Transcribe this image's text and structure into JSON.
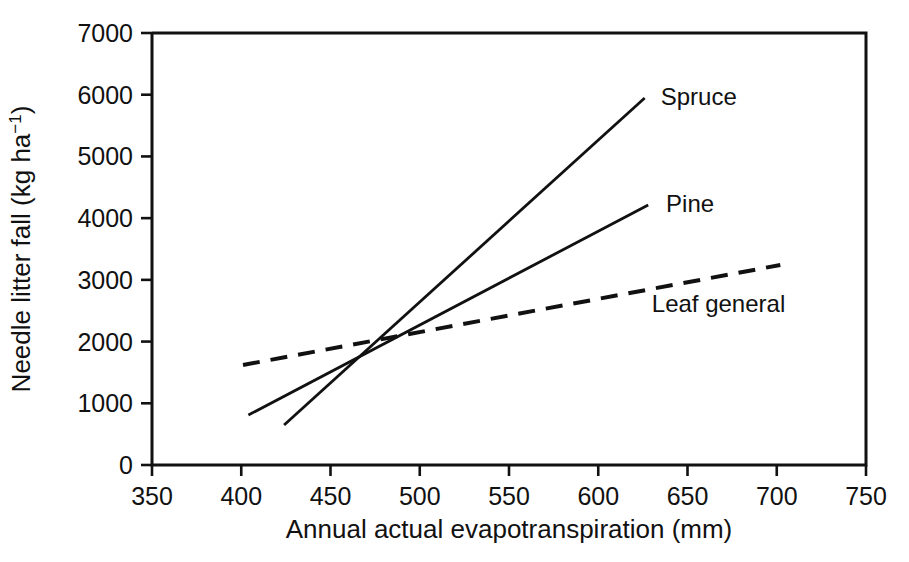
{
  "chart_data": {
    "type": "line",
    "title": "",
    "xlabel": "Annual actual evapotranspiration (mm)",
    "ylabel": "Needle litter fall (kg ha−1)",
    "ylabel_parts": {
      "main": "Needle litter fall (kg ha",
      "superscript": "−1",
      "tail": ")"
    },
    "xlim": [
      350,
      750
    ],
    "ylim": [
      0,
      7000
    ],
    "xticks": [
      350,
      400,
      450,
      500,
      550,
      600,
      650,
      700,
      750
    ],
    "yticks": [
      0,
      1000,
      2000,
      3000,
      4000,
      5000,
      6000,
      7000
    ],
    "xtick_labels": [
      "350",
      "400",
      "450",
      "500",
      "550",
      "600",
      "650",
      "700",
      "750"
    ],
    "ytick_labels": [
      "0",
      "1000",
      "2000",
      "3000",
      "4000",
      "5000",
      "6000",
      "7000"
    ],
    "grid": false,
    "legend_position": "inline-end-of-line",
    "line_color": "#111111",
    "series": [
      {
        "name": "Spruce",
        "style": "solid",
        "label": "Spruce",
        "x": [
          424,
          626
        ],
        "y": [
          648,
          5947
        ],
        "label_x": 635,
        "label_y": 5980
      },
      {
        "name": "Pine",
        "style": "solid",
        "label": "Pine",
        "x": [
          404,
          628
        ],
        "y": [
          810,
          4213
        ],
        "label_x": 638,
        "label_y": 4240
      },
      {
        "name": "Leaf general",
        "style": "dashed",
        "label": "Leaf general",
        "x": [
          401,
          702
        ],
        "y": [
          1620,
          3241
        ],
        "label_x": 630,
        "label_y": 2620
      }
    ]
  }
}
